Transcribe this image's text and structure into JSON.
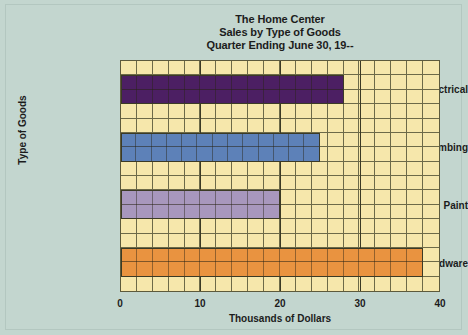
{
  "chart_data": {
    "type": "bar",
    "orientation": "horizontal",
    "title": "The Home Center",
    "subtitle": "Sales by Type of Goods",
    "subtitle2": "Quarter Ending June 30, 19--",
    "title_lines": [
      "The Home Center",
      "Sales by Type of Goods",
      "Quarter Ending June 30, 19--"
    ],
    "categories": [
      "Electrical",
      "Plumbing",
      "Paint",
      "Hardware"
    ],
    "values": [
      28,
      25,
      20,
      38
    ],
    "bar_colors": [
      "#4c1f63",
      "#5d81b8",
      "#a897bd",
      "#e99340"
    ],
    "xlabel": "Thousands of Dollars",
    "ylabel": "Type of Goods",
    "xlim": [
      0,
      40
    ],
    "xticks": [
      0,
      10,
      20,
      30,
      40
    ],
    "xtick_labels": [
      "0",
      "10",
      "20",
      "30",
      "40"
    ],
    "grid": true,
    "grid_columns": 20,
    "grid_rows": 16,
    "legend": "none",
    "plot_background": "#f6e7ab",
    "page_background": "#c3d6cf"
  }
}
